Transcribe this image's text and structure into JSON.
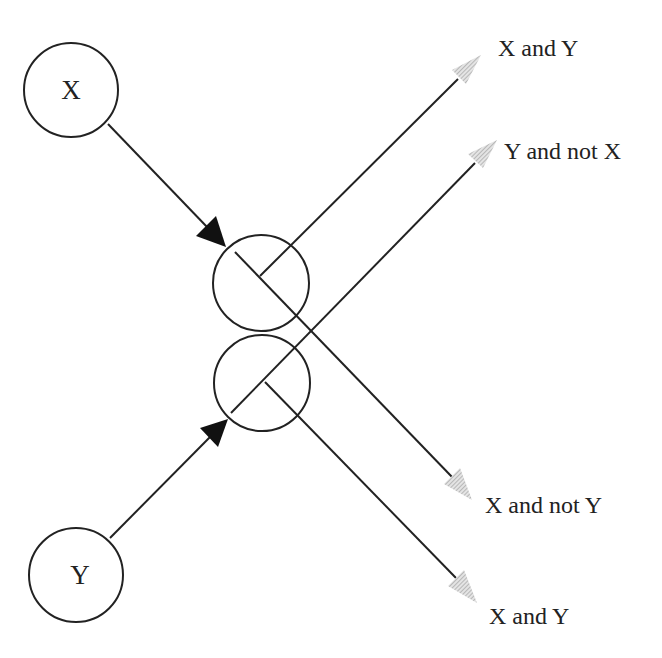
{
  "nodes": {
    "x": {
      "label": "X"
    },
    "y": {
      "label": "Y"
    },
    "upper_gate": {
      "label": ""
    },
    "lower_gate": {
      "label": ""
    }
  },
  "outputs": [
    {
      "label": "X and Y"
    },
    {
      "label": "Y and not X"
    },
    {
      "label": "X and not Y"
    },
    {
      "label": "X and Y"
    }
  ],
  "colors": {
    "stroke": "#222222",
    "output_arrow": "#b8b8b8"
  }
}
